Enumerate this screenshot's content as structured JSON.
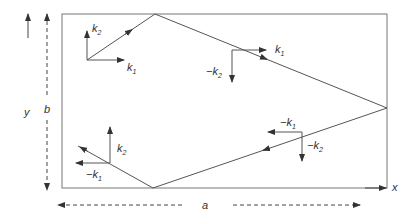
{
  "diagram": {
    "type": "waveguide wave-vector reflection diagram",
    "rectangle": {
      "width_label": "a",
      "height_label": "b"
    },
    "axes": {
      "x_label": "x",
      "y_label": "y"
    },
    "vectors": [
      {
        "position": "top-left",
        "labels": [
          "k",
          "k"
        ],
        "subs": [
          "2",
          "1"
        ],
        "signs": [
          "",
          ""
        ]
      },
      {
        "position": "top-right",
        "labels": [
          "k",
          "k"
        ],
        "subs": [
          "1",
          "2"
        ],
        "signs": [
          "",
          "−"
        ]
      },
      {
        "position": "bottom-right",
        "labels": [
          "k",
          "k"
        ],
        "subs": [
          "1",
          "2"
        ],
        "signs": [
          "−",
          "−"
        ]
      },
      {
        "position": "bottom-left",
        "labels": [
          "k",
          "k"
        ],
        "subs": [
          "2",
          "1"
        ],
        "signs": [
          "",
          "−"
        ]
      }
    ],
    "colors": {
      "line": "#555555",
      "text": "#333333"
    }
  }
}
